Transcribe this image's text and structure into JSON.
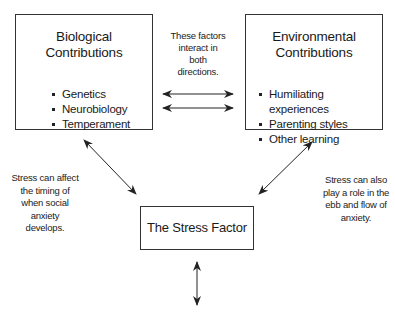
{
  "diagram": {
    "biological": {
      "title_line1": "Biological",
      "title_line2": "Contributions",
      "items": [
        "Genetics",
        "Neurobiology",
        "Temperament"
      ]
    },
    "environmental": {
      "title_line1": "Environmental",
      "title_line2": "Contributions",
      "items": [
        "Humiliating experiences",
        "Parenting styles",
        "Other learning"
      ]
    },
    "stress": {
      "title": "The Stress Factor"
    },
    "notes": {
      "interaction": [
        "These factors",
        "interact in",
        "both",
        "directions."
      ],
      "timing": [
        "Stress can affect",
        "the timing of",
        "when social",
        "anxiety",
        "develops."
      ],
      "ebb_flow": [
        "Stress can also",
        "play a role in the",
        "ebb and flow of",
        "anxiety."
      ]
    },
    "colors": {
      "line": "#222222",
      "border": "#333333",
      "background": "#ffffff"
    }
  }
}
